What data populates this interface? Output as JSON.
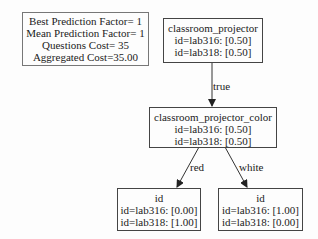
{
  "info_box": {
    "lines": [
      "Best Prediction Factor= 1",
      "Mean Prediction Factor= 1",
      "Questions Cost= 35",
      "Aggregated Cost=35.00"
    ]
  },
  "nodes": {
    "root": {
      "title": "classroom_projector",
      "lines": [
        "id=lab316: [0.50]",
        "id=lab318: [0.50]"
      ]
    },
    "middle": {
      "title": "classroom_projector_color",
      "lines": [
        "id=lab316: [0.50]",
        "id=lab318: [0.50]"
      ]
    },
    "leaf_red": {
      "title": "id",
      "lines": [
        "id=lab316: [0.00]",
        "id=lab318: [1.00]"
      ]
    },
    "leaf_white": {
      "title": "id",
      "lines": [
        "id=lab316: [1.00]",
        "id=lab318: [0.00]"
      ]
    }
  },
  "edges": {
    "root_to_middle": "true",
    "middle_to_red": "red",
    "middle_to_white": "white"
  },
  "colors": {
    "border": "#444444",
    "text": "#222222",
    "background": "#fdfdfd"
  }
}
